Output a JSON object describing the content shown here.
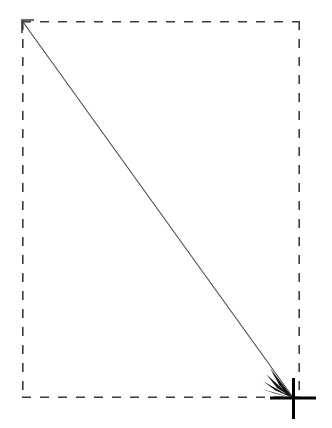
{
  "canvas": {
    "width": 332,
    "height": 428,
    "background_color": "#ffffff",
    "title": "Dashed bounding box with diagonal drag vector and crosshair endpoint"
  },
  "colors": {
    "dash_stroke": "#3b3b3b",
    "line_stroke": "#4a4a4a",
    "arrowhead_fill": "#111111",
    "crosshair_stroke": "#000000"
  },
  "bounding_box": {
    "label": "selection-bounding-box",
    "style": "dashed",
    "left": 22,
    "top": 21,
    "right": 300,
    "bottom": 398,
    "width": 278,
    "height": 377,
    "stroke_width": 1.6,
    "dash_length": 9,
    "gap_length": 9
  },
  "drag_vector": {
    "label": "diagonal-drag-line",
    "start_x": 23,
    "start_y": 22,
    "end_x": 292,
    "end_y": 396,
    "stroke_width": 1.1,
    "direction": "top-left to bottom-right"
  },
  "start_marker": {
    "label": "open-v-arrowhead",
    "type": "open-chevron",
    "points": "34,20 22,20 22,33",
    "tip_x": 22,
    "tip_y": 20,
    "stroke_width": 1.6,
    "orientation": "up-left"
  },
  "end_marker": {
    "label": "barbed-arrowhead",
    "type": "filled-multi-barb",
    "tip_x": 293,
    "tip_y": 398,
    "orientation": "down-right",
    "barb_count": 4
  },
  "crosshair": {
    "label": "crosshair-target",
    "center_x": 293,
    "center_y": 398,
    "vertical_top": 378,
    "vertical_bottom": 419,
    "horizontal_left": 270,
    "horizontal_right": 316,
    "stroke_width": 3
  }
}
